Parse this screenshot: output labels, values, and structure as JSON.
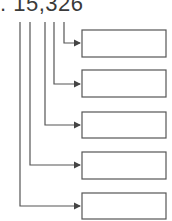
{
  "number": {
    "prefix": ".",
    "value": "15,326"
  },
  "diagram": {
    "boxes": [
      {
        "label": "",
        "digit_index": 4
      },
      {
        "label": "",
        "digit_index": 3
      },
      {
        "label": "",
        "digit_index": 2
      },
      {
        "label": "",
        "digit_index": 1
      },
      {
        "label": "",
        "digit_index": 0
      }
    ],
    "colors": {
      "line": "#555555",
      "text": "#3a3a3a",
      "box_border": "#555555"
    }
  }
}
